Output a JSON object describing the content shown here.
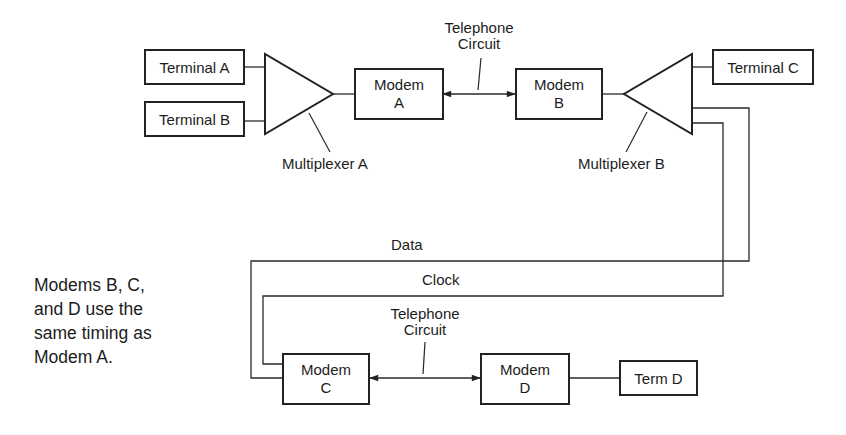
{
  "diagram": {
    "nodes": {
      "terminal_a": "Terminal A",
      "terminal_b": "Terminal B",
      "terminal_c": "Terminal C",
      "term_d": "Term D",
      "modem_a": {
        "line1": "Modem",
        "line2": "A"
      },
      "modem_b": {
        "line1": "Modem",
        "line2": "B"
      },
      "modem_c": {
        "line1": "Modem",
        "line2": "C"
      },
      "modem_d": {
        "line1": "Modem",
        "line2": "D"
      }
    },
    "labels": {
      "multiplexer_a": "Multiplexer A",
      "multiplexer_b": "Multiplexer B",
      "telephone_circuit_top": {
        "line1": "Telephone",
        "line2": "Circuit"
      },
      "telephone_circuit_bottom": {
        "line1": "Telephone",
        "line2": "Circuit"
      },
      "data": "Data",
      "clock": "Clock"
    },
    "note": {
      "line1": "Modems B, C,",
      "line2": "and D use the",
      "line3": "same timing as",
      "line4": "Modem A."
    },
    "edges": [
      {
        "from": "Terminal A",
        "to": "Multiplexer A"
      },
      {
        "from": "Terminal B",
        "to": "Multiplexer A"
      },
      {
        "from": "Multiplexer A",
        "to": "Modem A"
      },
      {
        "from": "Modem A",
        "to": "Modem B",
        "label": "Telephone Circuit",
        "bidirectional": true
      },
      {
        "from": "Modem B",
        "to": "Multiplexer B"
      },
      {
        "from": "Multiplexer B",
        "to": "Terminal C"
      },
      {
        "from": "Multiplexer B",
        "to": "Modem C",
        "label": "Data"
      },
      {
        "from": "Multiplexer B",
        "to": "Modem C",
        "label": "Clock"
      },
      {
        "from": "Modem C",
        "to": "Modem D",
        "label": "Telephone Circuit",
        "bidirectional": true
      },
      {
        "from": "Modem D",
        "to": "Term D"
      }
    ],
    "colors": {
      "stroke": "#222222",
      "text": "#1c1c1c",
      "background": "#ffffff"
    }
  }
}
